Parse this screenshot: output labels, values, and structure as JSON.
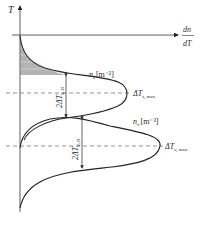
{
  "figure": {
    "axes": {
      "vertical_label": "T",
      "horizontal_label_num": "dn",
      "horizontal_label_den": "dT"
    },
    "curves": [
      {
        "name": "surface nucleation",
        "label_main": "n",
        "label_sub": "s",
        "unit": "[m⁻²]"
      },
      {
        "name": "volume nucleation",
        "label_main": "n",
        "label_sub": "v",
        "unit": "[m⁻³]"
      }
    ],
    "annotations": {
      "s_max_main": "ΔT",
      "s_max_sub": "s, max",
      "v_max_main": "ΔT",
      "v_max_sub": "v, max",
      "s_sigma_main": "2ΔT",
      "s_sigma_sub": "s, σ",
      "v_sigma_main": "2ΔT",
      "v_sigma_sub": "v, σ"
    },
    "colors": {
      "line": "#222222",
      "dashed": "#555555",
      "hatch": "#555555"
    }
  }
}
